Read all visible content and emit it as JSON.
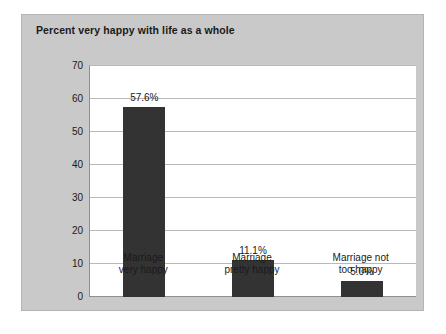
{
  "chart_data": {
    "type": "bar",
    "title": "Percent very happy with life as a whole",
    "xlabel": "",
    "ylabel": "",
    "ylim": [
      0,
      70
    ],
    "yticks": [
      0,
      10,
      20,
      30,
      40,
      50,
      60,
      70
    ],
    "grid": true,
    "legend": false,
    "categories": [
      "Marriage very happy",
      "Marriage pretty happy",
      "Marriage not too happy"
    ],
    "category_lines": [
      [
        "Marriage",
        "very happy"
      ],
      [
        "Marriage",
        "pretty happy"
      ],
      [
        "Marriage not",
        "too happy"
      ]
    ],
    "values": [
      57.6,
      11.1,
      5.0
    ],
    "value_labels": [
      "57.6%",
      "11.1%",
      "5.0%"
    ],
    "bar_color": "#333333",
    "panel_color": "#c9c9c9",
    "plot_background": "#ffffff",
    "gridline_color": "#b9b9b9"
  }
}
